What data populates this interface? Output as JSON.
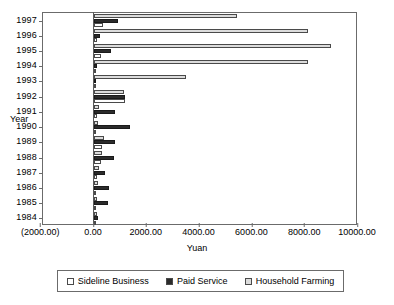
{
  "chart_data": {
    "type": "bar",
    "orientation": "horizontal",
    "title": "",
    "xlabel": "Yuan",
    "ylabel": "Year",
    "xlim": [
      -2000,
      10000
    ],
    "grid": false,
    "legend_position": "bottom",
    "categories": [
      "1997",
      "1996",
      "1995",
      "1994",
      "1993",
      "1992",
      "1991",
      "1990",
      "1989",
      "1988",
      "1987",
      "1986",
      "1985",
      "1984"
    ],
    "x_tick_labels": [
      "(2000.00)",
      "0.00",
      "2000.00",
      "4000.00",
      "6000.00",
      "8000.00",
      "10000.00"
    ],
    "x_tick_values": [
      -2000,
      0,
      2000,
      4000,
      6000,
      8000,
      10000
    ],
    "series": [
      {
        "name": "Household Farming",
        "color": "#dcdcdc",
        "values": [
          5400,
          8110,
          8980,
          8100,
          3480,
          1120,
          180,
          140,
          360,
          310,
          190,
          160,
          130,
          110
        ]
      },
      {
        "name": "Paid Service",
        "color": "#2b2b2b",
        "values": [
          900,
          210,
          650,
          120,
          50,
          1190,
          780,
          1350,
          790,
          740,
          430,
          570,
          540,
          140
        ]
      },
      {
        "name": "Sideline Business",
        "color": "#ffffff",
        "values": [
          330,
          110,
          270,
          40,
          30,
          1160,
          100,
          60,
          290,
          250,
          110,
          90,
          80,
          70
        ]
      }
    ]
  },
  "legend": {
    "items": [
      {
        "label": "Sideline Business",
        "swatch": "#ffffff"
      },
      {
        "label": "Paid Service",
        "swatch": "#2b2b2b"
      },
      {
        "label": "Household Farming",
        "swatch": "#dcdcdc"
      }
    ]
  }
}
